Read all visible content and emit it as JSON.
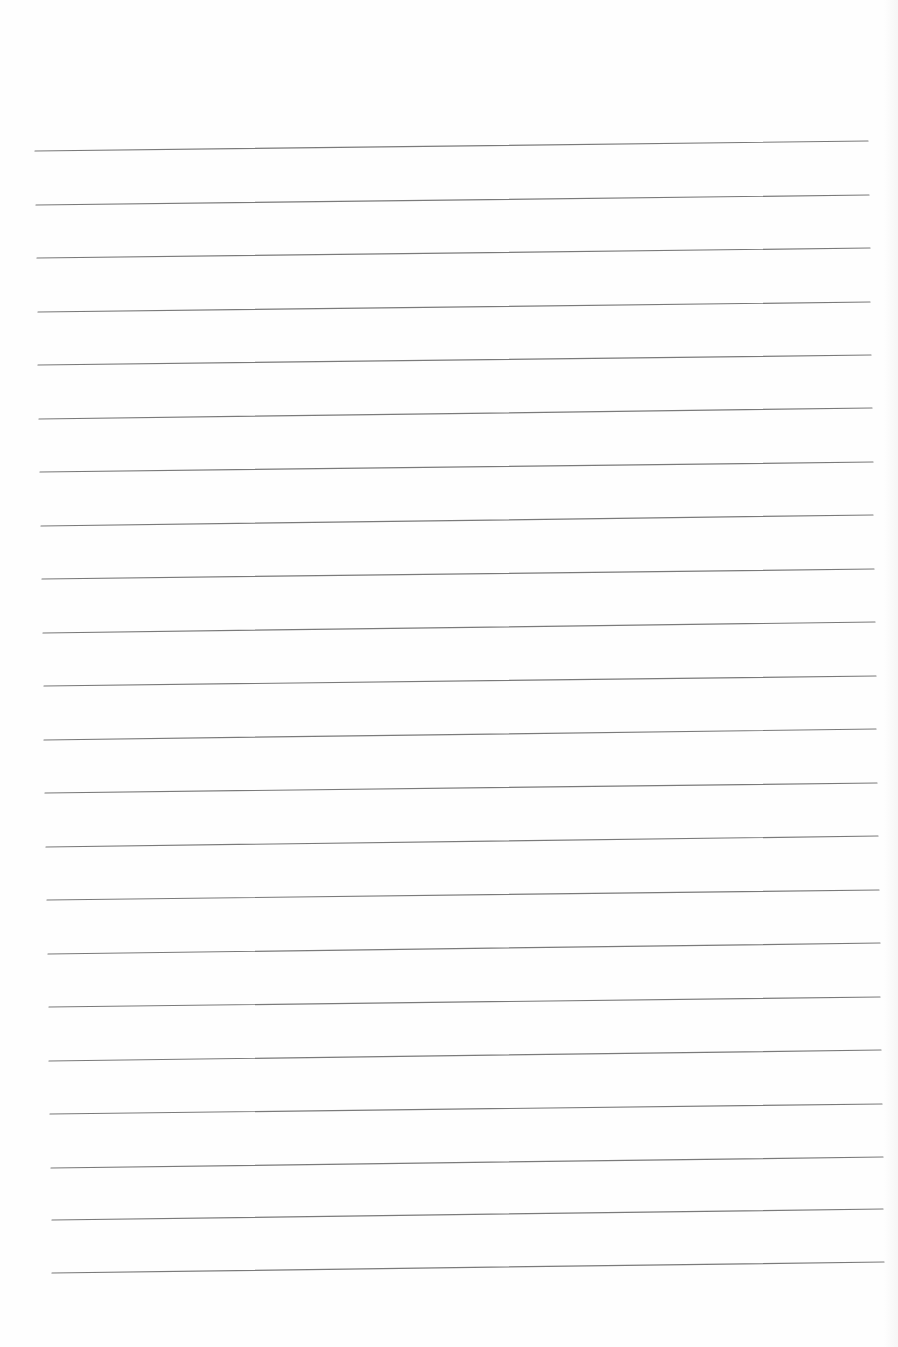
{
  "page": {
    "type": "blank-lined-paper",
    "background_color": "#fefefe",
    "rule_color": "#7a7a7a",
    "rule_count": 22,
    "rules": [
      {
        "x1": 35,
        "y1": 151,
        "x2": 868,
        "y2": 141
      },
      {
        "x1": 36,
        "y1": 205,
        "x2": 869,
        "y2": 195
      },
      {
        "x1": 37,
        "y1": 258,
        "x2": 870,
        "y2": 248
      },
      {
        "x1": 38,
        "y1": 312,
        "x2": 870,
        "y2": 302
      },
      {
        "x1": 38,
        "y1": 365,
        "x2": 871,
        "y2": 355
      },
      {
        "x1": 39,
        "y1": 419,
        "x2": 872,
        "y2": 408
      },
      {
        "x1": 40,
        "y1": 472,
        "x2": 873,
        "y2": 462
      },
      {
        "x1": 41,
        "y1": 526,
        "x2": 873,
        "y2": 515
      },
      {
        "x1": 42,
        "y1": 579,
        "x2": 874,
        "y2": 569
      },
      {
        "x1": 43,
        "y1": 633,
        "x2": 875,
        "y2": 622
      },
      {
        "x1": 44,
        "y1": 686,
        "x2": 876,
        "y2": 676
      },
      {
        "x1": 44,
        "y1": 740,
        "x2": 876,
        "y2": 729
      },
      {
        "x1": 45,
        "y1": 793,
        "x2": 877,
        "y2": 783
      },
      {
        "x1": 46,
        "y1": 847,
        "x2": 878,
        "y2": 836
      },
      {
        "x1": 47,
        "y1": 900,
        "x2": 879,
        "y2": 890
      },
      {
        "x1": 48,
        "y1": 954,
        "x2": 880,
        "y2": 943
      },
      {
        "x1": 49,
        "y1": 1007,
        "x2": 880,
        "y2": 997
      },
      {
        "x1": 49,
        "y1": 1061,
        "x2": 881,
        "y2": 1050
      },
      {
        "x1": 50,
        "y1": 1114,
        "x2": 882,
        "y2": 1104
      },
      {
        "x1": 51,
        "y1": 1168,
        "x2": 883,
        "y2": 1157
      },
      {
        "x1": 52,
        "y1": 1220,
        "x2": 883,
        "y2": 1209
      },
      {
        "x1": 52,
        "y1": 1273,
        "x2": 884,
        "y2": 1262
      }
    ]
  }
}
